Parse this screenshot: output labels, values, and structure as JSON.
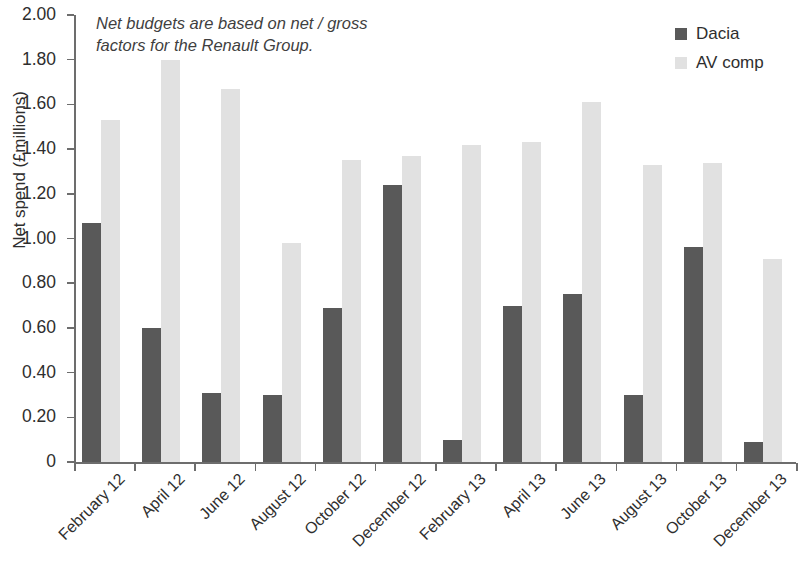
{
  "chart_data": {
    "type": "bar",
    "title": "",
    "subtitle": "",
    "xlabel": "",
    "ylabel": "Net spend (£millions)",
    "ylim": [
      0,
      2.0
    ],
    "ytick_step": 0.2,
    "ytick_labels": [
      "2.00",
      "1.80",
      "1.60",
      "1.40",
      "1.20",
      "1.00",
      "0.80",
      "0.60",
      "0.40",
      "0.20",
      "0"
    ],
    "ytick_values": [
      2.0,
      1.8,
      1.6,
      1.4,
      1.2,
      1.0,
      0.8,
      0.6,
      0.4,
      0.2,
      0
    ],
    "grid": false,
    "legend_position": "top-right",
    "categories": [
      "February 12",
      "April 12",
      "June 12",
      "August 12",
      "October 12",
      "December 12",
      "February 13",
      "April 13",
      "June 13",
      "August 13",
      "October 13",
      "December 13"
    ],
    "series": [
      {
        "name": "Dacia",
        "color": "#595959",
        "values": [
          1.07,
          0.6,
          0.31,
          0.3,
          0.69,
          1.24,
          0.1,
          0.7,
          0.75,
          0.3,
          0.96,
          0.09
        ]
      },
      {
        "name": "AV comp",
        "color": "#e1e1e1",
        "values": [
          1.53,
          1.8,
          1.67,
          0.98,
          1.35,
          1.37,
          1.42,
          1.43,
          1.61,
          1.33,
          1.34,
          0.91
        ]
      }
    ],
    "annotations": [
      {
        "text": "Net budgets are based on net / gross factors for the Renault Group.",
        "style": "italic",
        "position": "top-left"
      }
    ]
  }
}
